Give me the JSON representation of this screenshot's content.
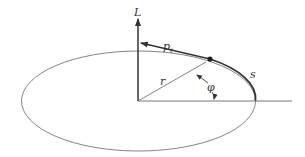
{
  "diagram": {
    "type": "orbital-angular-momentum-sketch",
    "labels": {
      "angular_momentum": "L",
      "tangential_momentum_main": "p",
      "tangential_momentum_sub": "t",
      "radius": "r",
      "angle": "φ",
      "arc_length": "s"
    },
    "colors": {
      "stroke": "#333333",
      "thin_stroke": "#777777",
      "background": "#ffffff"
    }
  }
}
